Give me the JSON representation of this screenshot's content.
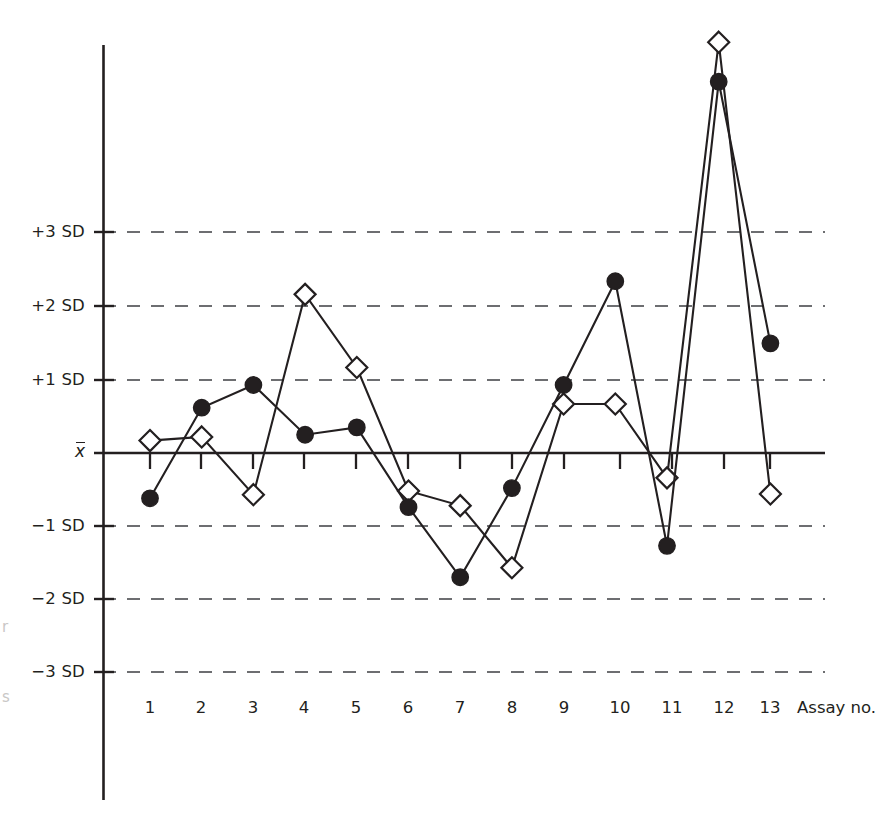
{
  "chart_data": {
    "type": "line",
    "title": "",
    "subtitle": "",
    "xlabel": "Assay no.",
    "ylabel": "",
    "grid": true,
    "legend_position": "none",
    "x": [
      1,
      2,
      3,
      4,
      5,
      6,
      7,
      8,
      9,
      10,
      11,
      12,
      13
    ],
    "categories": [
      "1",
      "2",
      "3",
      "4",
      "5",
      "6",
      "7",
      "8",
      "9",
      "10",
      "11",
      "12",
      "13"
    ],
    "xtick_labels": [
      "1",
      "2",
      "3",
      "4",
      "5",
      "6",
      "7",
      "8",
      "9",
      "10",
      "11",
      "12",
      "13"
    ],
    "ytick_labels": [
      "+3 SD",
      "+2 SD",
      "+1 SD",
      "x̄",
      "−1 SD",
      "−2 SD",
      "−3 SD"
    ],
    "ytick_values": [
      3,
      2,
      1,
      0,
      -1,
      -2,
      -3
    ],
    "ylim": [
      -3.3,
      5.6
    ],
    "yunit": "SD",
    "gridlines": [
      3,
      2,
      1,
      -1,
      -2,
      -3
    ],
    "zero_line_label": "x̄",
    "series": [
      {
        "name": "open-diamond-series",
        "marker": "open-diamond",
        "values": [
          0.17,
          0.22,
          -0.57,
          2.17,
          1.17,
          -0.52,
          -0.72,
          -1.57,
          0.67,
          0.67,
          -0.34,
          5.62,
          -0.56
        ]
      },
      {
        "name": "filled-circle-series",
        "marker": "filled-circle",
        "values": [
          -0.62,
          0.62,
          0.93,
          0.25,
          0.35,
          -0.74,
          -1.7,
          -0.48,
          0.93,
          2.35,
          -1.27,
          5.08,
          1.5
        ]
      }
    ],
    "colors": {
      "line": "#231f20",
      "grid": "#6d6e71",
      "axis": "#231f20",
      "marker_fill_open": "#ffffff",
      "marker_fill_solid": "#231f20"
    }
  },
  "axis": {
    "x_title": "Assay no."
  },
  "edge_fragments": {
    "upper": "r",
    "lower": "s"
  }
}
